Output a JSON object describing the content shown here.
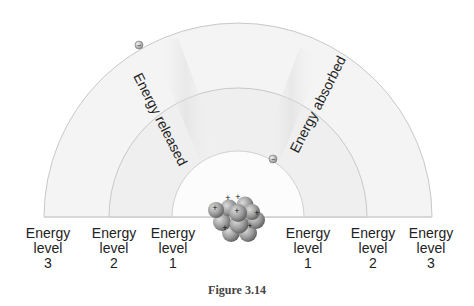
{
  "diagram": {
    "transitions": {
      "released": "Energy released",
      "absorbed": "Energy absorbed"
    },
    "levels_left": [
      {
        "word1": "Energy",
        "word2": "level",
        "num": "3"
      },
      {
        "word1": "Energy",
        "word2": "level",
        "num": "2"
      },
      {
        "word1": "Energy",
        "word2": "level",
        "num": "1"
      }
    ],
    "levels_right": [
      {
        "word1": "Energy",
        "word2": "level",
        "num": "1"
      },
      {
        "word1": "Energy",
        "word2": "level",
        "num": "2"
      },
      {
        "word1": "Energy",
        "word2": "level",
        "num": "3"
      }
    ],
    "electron_symbol": "−",
    "proton_symbol": "+",
    "caption": "Figure 3.14"
  },
  "colors": {
    "ring_line": "#c8c8c8",
    "ring_fill": "#f3f3f3",
    "inner_fill": "#fbfbfb",
    "band_shade": "#e6e6e6",
    "nucleus": "#8a8a8a",
    "text": "#222222"
  }
}
